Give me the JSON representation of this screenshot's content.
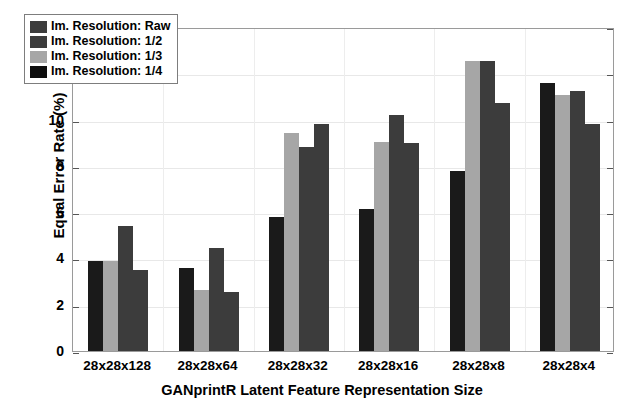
{
  "chart_data": {
    "type": "bar",
    "title": "",
    "xlabel": "GANprintR Latent Feature Representation Size",
    "ylabel": "Equal Error Rate (%)",
    "ylim": [
      0,
      14
    ],
    "yticks": [
      0,
      2,
      4,
      6,
      8,
      10,
      12,
      14
    ],
    "ytick_labels": [
      "0",
      "2",
      "4",
      "6",
      "8",
      "10",
      "12",
      "14"
    ],
    "grid": true,
    "legend_position": "upper-left",
    "categories": [
      "28x28x128",
      "28x28x64",
      "28x28x32",
      "28x28x16",
      "28x28x8",
      "28x28x4"
    ],
    "series": [
      {
        "name": "Im. Resolution: Raw",
        "color": "#1a1a1a",
        "values": [
          3.9,
          3.6,
          5.8,
          6.15,
          7.8,
          11.6
        ]
      },
      {
        "name": "Im. Resolution: 1/2",
        "color": "#a6a6a6",
        "values": [
          3.9,
          2.65,
          9.4,
          9.05,
          12.55,
          11.05
        ]
      },
      {
        "name": "Im. Resolution: 1/3",
        "color": "#3c3c3c",
        "values": [
          5.4,
          4.45,
          8.8,
          10.2,
          12.55,
          11.25
        ]
      },
      {
        "name": "Im. Resolution: 1/4",
        "color": "#3c3c3c",
        "values": [
          3.5,
          2.55,
          9.8,
          9.0,
          10.7,
          9.8
        ]
      }
    ],
    "legend_swatch_colors": [
      "#3c3c3c",
      "#3c3c3c",
      "#a6a6a6",
      "#0d0d0d"
    ],
    "axis_color": "#9a9a9a",
    "grid_color": "#e8e8e8",
    "background": "#ffffff"
  }
}
